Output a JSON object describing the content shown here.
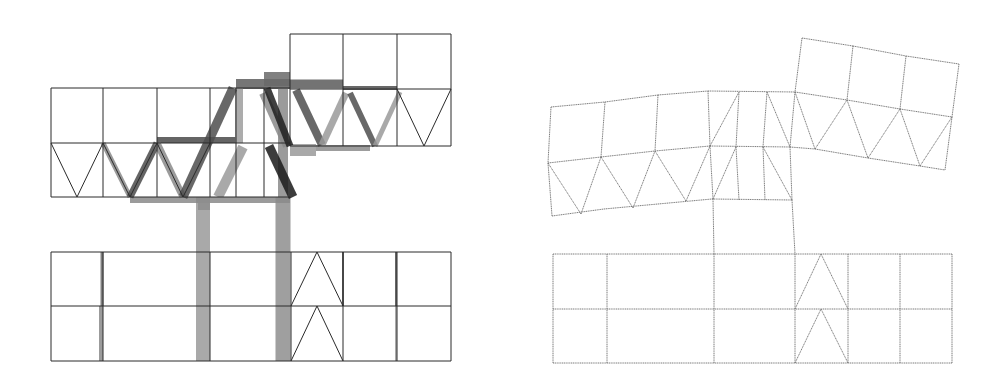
{
  "figure": {
    "panels": [
      {
        "id": "left",
        "label": "undeformed frame with member force/stress bars",
        "thin_lines": [
          [
            51,
            88,
            210,
            88
          ],
          [
            51,
            143,
            290,
            143
          ],
          [
            51,
            197,
            290,
            197
          ],
          [
            51,
            88,
            51,
            197
          ],
          [
            103,
            88,
            103,
            197
          ],
          [
            157,
            88,
            157,
            197
          ],
          [
            210,
            88,
            210,
            197
          ],
          [
            290,
            34,
            451,
            34
          ],
          [
            290,
            89,
            451,
            89
          ],
          [
            290,
            146,
            451,
            146
          ],
          [
            290,
            34,
            290,
            146
          ],
          [
            343,
            34,
            343,
            146
          ],
          [
            397,
            34,
            397,
            146
          ],
          [
            451,
            34,
            451,
            146
          ],
          [
            210,
            88,
            290,
            88
          ],
          [
            236,
            88,
            236,
            197
          ],
          [
            264,
            88,
            264,
            197
          ],
          [
            51,
            143,
            77,
            197
          ],
          [
            77,
            197,
            103,
            143
          ],
          [
            103,
            143,
            130,
            197
          ],
          [
            130,
            197,
            157,
            143
          ],
          [
            157,
            143,
            183,
            197
          ],
          [
            183,
            197,
            210,
            143
          ],
          [
            397,
            89,
            424,
            146
          ],
          [
            424,
            146,
            451,
            89
          ],
          [
            51,
            252,
            451,
            252
          ],
          [
            51,
            306,
            451,
            306
          ],
          [
            51,
            361,
            451,
            361
          ],
          [
            51,
            252,
            51,
            361
          ],
          [
            103,
            252,
            103,
            361
          ],
          [
            210,
            252,
            210,
            361
          ],
          [
            291,
            252,
            291,
            361
          ],
          [
            343,
            252,
            343,
            361
          ],
          [
            397,
            252,
            397,
            361
          ],
          [
            451,
            252,
            451,
            361
          ],
          [
            291,
            306,
            317,
            252
          ],
          [
            317,
            252,
            343,
            306
          ],
          [
            291,
            361,
            317,
            306
          ],
          [
            317,
            306,
            343,
            361
          ]
        ],
        "thick_bars": [
          {
            "x1": 203,
            "y1": 197,
            "x2": 203,
            "y2": 361,
            "w": 14,
            "c": "#9a9a9a"
          },
          {
            "x1": 283,
            "y1": 197,
            "x2": 283,
            "y2": 361,
            "w": 15,
            "c": "#8e8e8e"
          },
          {
            "x1": 236,
            "y1": 84,
            "x2": 290,
            "y2": 84,
            "w": 10,
            "c": "#5e5e5e"
          },
          {
            "x1": 290,
            "y1": 84,
            "x2": 343,
            "y2": 84,
            "w": 9,
            "c": "#5a5a5a"
          },
          {
            "x1": 343,
            "y1": 88,
            "x2": 397,
            "y2": 88,
            "w": 4,
            "c": "#4e4e4e"
          },
          {
            "x1": 157,
            "y1": 140,
            "x2": 236,
            "y2": 140,
            "w": 6,
            "c": "#4a4a4a"
          },
          {
            "x1": 264,
            "y1": 79,
            "x2": 290,
            "y2": 79,
            "w": 14,
            "c": "#6a6a6a"
          },
          {
            "x1": 130,
            "y1": 200,
            "x2": 290,
            "y2": 200,
            "w": 6,
            "c": "#8a8a8a"
          },
          {
            "x1": 290,
            "y1": 150,
            "x2": 316,
            "y2": 150,
            "w": 12,
            "c": "#9a9a9a"
          },
          {
            "x1": 316,
            "y1": 148,
            "x2": 370,
            "y2": 148,
            "w": 6,
            "c": "#8c8c8c"
          },
          {
            "x1": 198,
            "y1": 204,
            "x2": 210,
            "y2": 204,
            "w": 12,
            "c": "#8e8e8e"
          },
          {
            "x1": 239,
            "y1": 88,
            "x2": 239,
            "y2": 143,
            "w": 8,
            "c": "#9e9e9e"
          },
          {
            "x1": 283,
            "y1": 88,
            "x2": 283,
            "y2": 197,
            "w": 10,
            "c": "#8a8a8a"
          },
          {
            "x1": 103,
            "y1": 143,
            "x2": 130,
            "y2": 197,
            "w": 5,
            "c": "#8a8a8a"
          },
          {
            "x1": 130,
            "y1": 197,
            "x2": 157,
            "y2": 143,
            "w": 7,
            "c": "#4a4a4a"
          },
          {
            "x1": 157,
            "y1": 143,
            "x2": 183,
            "y2": 197,
            "w": 7,
            "c": "#8a8a8a"
          },
          {
            "x1": 183,
            "y1": 197,
            "x2": 233,
            "y2": 88,
            "w": 9,
            "c": "#4e4e4e"
          },
          {
            "x1": 218,
            "y1": 197,
            "x2": 243,
            "y2": 147,
            "w": 10,
            "c": "#9a9a9a"
          },
          {
            "x1": 263,
            "y1": 93,
            "x2": 287,
            "y2": 146,
            "w": 8,
            "c": "#8a8a8a"
          },
          {
            "x1": 267,
            "y1": 88,
            "x2": 290,
            "y2": 146,
            "w": 7,
            "c": "#1e1e1e"
          },
          {
            "x1": 269,
            "y1": 146,
            "x2": 293,
            "y2": 197,
            "w": 9,
            "c": "#1a1a1a"
          },
          {
            "x1": 296,
            "y1": 90,
            "x2": 322,
            "y2": 145,
            "w": 8,
            "c": "#4e4e4e"
          },
          {
            "x1": 322,
            "y1": 145,
            "x2": 346,
            "y2": 93,
            "w": 7,
            "c": "#9a9a9a"
          },
          {
            "x1": 350,
            "y1": 93,
            "x2": 375,
            "y2": 146,
            "w": 6,
            "c": "#4e4e4e"
          },
          {
            "x1": 375,
            "y1": 146,
            "x2": 400,
            "y2": 92,
            "w": 5,
            "c": "#9a9a9a"
          },
          {
            "x1": 102,
            "y1": 252,
            "x2": 102,
            "y2": 306,
            "w": 3,
            "c": "#6a6a6a"
          },
          {
            "x1": 101,
            "y1": 306,
            "x2": 101,
            "y2": 361,
            "w": 4,
            "c": "#8a8a8a"
          },
          {
            "x1": 343,
            "y1": 252,
            "x2": 343,
            "y2": 306,
            "w": 2,
            "c": "#4a4a4a"
          },
          {
            "x1": 396,
            "y1": 252,
            "x2": 396,
            "y2": 306,
            "w": 2,
            "c": "#4a4a4a"
          },
          {
            "x1": 396,
            "y1": 306,
            "x2": 396,
            "y2": 361,
            "w": 2,
            "c": "#9a9a9a"
          }
        ]
      },
      {
        "id": "right",
        "label": "deformed frame shape",
        "thin_lines": [
          [
            551,
            107,
            605,
            102
          ],
          [
            605,
            102,
            658,
            95
          ],
          [
            658,
            95,
            708,
            91
          ],
          [
            708,
            91,
            795,
            92
          ],
          [
            548,
            163,
            601,
            157
          ],
          [
            601,
            157,
            655,
            151
          ],
          [
            655,
            151,
            710,
            146
          ],
          [
            710,
            146,
            790,
            147
          ],
          [
            790,
            147,
            815,
            149
          ],
          [
            552,
            216,
            604,
            209
          ],
          [
            604,
            209,
            658,
            204
          ],
          [
            658,
            204,
            712,
            199
          ],
          [
            712,
            199,
            792,
            200
          ],
          [
            551,
            107,
            548,
            163
          ],
          [
            548,
            163,
            552,
            216
          ],
          [
            605,
            102,
            601,
            157
          ],
          [
            658,
            95,
            655,
            151
          ],
          [
            708,
            91,
            710,
            146
          ],
          [
            710,
            146,
            713,
            199
          ],
          [
            739,
            92,
            736,
            147
          ],
          [
            736,
            147,
            739,
            200
          ],
          [
            767,
            92,
            763,
            147
          ],
          [
            763,
            147,
            765,
            200
          ],
          [
            795,
            92,
            790,
            147
          ],
          [
            790,
            147,
            792,
            200
          ],
          [
            548,
            163,
            581,
            214
          ],
          [
            581,
            214,
            601,
            157
          ],
          [
            601,
            157,
            633,
            208
          ],
          [
            633,
            208,
            655,
            151
          ],
          [
            655,
            151,
            686,
            201
          ],
          [
            686,
            201,
            710,
            146
          ],
          [
            710,
            146,
            739,
            92
          ],
          [
            713,
            199,
            736,
            147
          ],
          [
            767,
            92,
            790,
            147
          ],
          [
            763,
            147,
            792,
            200
          ],
          [
            802,
            38,
            853,
            46
          ],
          [
            853,
            46,
            906,
            56
          ],
          [
            906,
            56,
            959,
            64
          ],
          [
            795,
            92,
            847,
            100
          ],
          [
            847,
            100,
            900,
            109
          ],
          [
            900,
            109,
            952,
            117
          ],
          [
            815,
            149,
            868,
            158
          ],
          [
            868,
            158,
            920,
            166
          ],
          [
            920,
            166,
            945,
            170
          ],
          [
            802,
            38,
            795,
            92
          ],
          [
            853,
            46,
            847,
            100
          ],
          [
            906,
            56,
            900,
            109
          ],
          [
            959,
            64,
            952,
            117
          ],
          [
            952,
            117,
            945,
            170
          ],
          [
            795,
            92,
            815,
            149
          ],
          [
            815,
            149,
            847,
            100
          ],
          [
            847,
            100,
            868,
            158
          ],
          [
            868,
            158,
            900,
            109
          ],
          [
            900,
            109,
            920,
            166
          ],
          [
            920,
            166,
            952,
            117
          ],
          [
            713,
            199,
            714,
            254
          ],
          [
            792,
            200,
            795,
            254
          ],
          [
            553,
            254,
            952,
            254
          ],
          [
            553,
            309,
            952,
            309
          ],
          [
            553,
            363,
            952,
            363
          ],
          [
            553,
            254,
            553,
            363
          ],
          [
            607,
            254,
            607,
            363
          ],
          [
            714,
            254,
            714,
            363
          ],
          [
            795,
            254,
            795,
            363
          ],
          [
            848,
            254,
            848,
            363
          ],
          [
            900,
            254,
            900,
            363
          ],
          [
            952,
            254,
            952,
            363
          ],
          [
            795,
            309,
            821,
            254
          ],
          [
            821,
            254,
            848,
            309
          ],
          [
            795,
            363,
            821,
            309
          ],
          [
            821,
            309,
            848,
            363
          ]
        ],
        "thick_bars": []
      }
    ]
  }
}
